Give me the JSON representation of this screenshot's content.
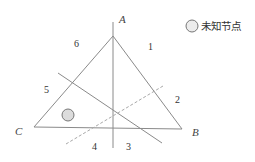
{
  "diagram": {
    "vertices": {
      "A": {
        "label": "A",
        "x": 113,
        "y": 36
      },
      "B": {
        "label": "B",
        "x": 182,
        "y": 129
      },
      "C": {
        "label": "C",
        "x": 34,
        "y": 127
      }
    },
    "region_labels": [
      "1",
      "2",
      "3",
      "4",
      "5",
      "6"
    ],
    "legend": {
      "label": "未知节点"
    },
    "colors": {
      "line": "#8a8a8a",
      "dashed_line": "#a8a8a8",
      "node_fill": "#dcdcdc",
      "node_stroke": "#777777"
    }
  }
}
